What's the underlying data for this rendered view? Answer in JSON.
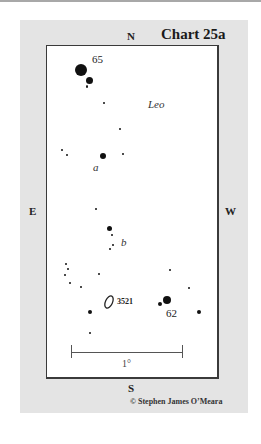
{
  "chart": {
    "title": "Chart 25a",
    "constellation": "Leo",
    "compass": {
      "north": "N",
      "south": "S",
      "east": "E",
      "west": "W"
    },
    "scale": {
      "label": "1°"
    },
    "credit": "© Stephen James O’Meara",
    "labels": {
      "star_65": "65",
      "star_62": "62",
      "star_a": "a",
      "star_b": "b",
      "galaxy_3521": "3521"
    },
    "colors": {
      "panel": "#e4e4e4",
      "chart_bg": "#ffffff",
      "star": "#111111",
      "border": "#3a3a3a"
    }
  }
}
